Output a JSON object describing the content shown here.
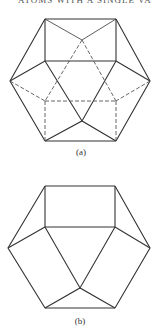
{
  "header": {
    "text": "ATOMS WITH A SINGLE VA"
  },
  "figures": [
    {
      "id": "a",
      "caption": "(a)",
      "description": "Cuboctahedron with hidden edges dashed"
    },
    {
      "id": "b",
      "caption": "(b)",
      "description": "Cuboctahedron, visible edges only"
    }
  ]
}
